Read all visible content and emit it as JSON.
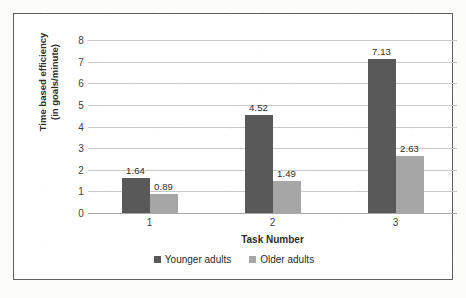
{
  "chart_data": {
    "type": "bar",
    "title": "",
    "subtitle": "",
    "xlabel": "Task Number",
    "ylabel": "Time based efficiency (in goals/minute)",
    "ylabel_line1": "Time based efficiency",
    "ylabel_line2": "(in goals/minute)",
    "categories": [
      "1",
      "2",
      "3"
    ],
    "series": [
      {
        "name": "Younger adults",
        "color": "#595959",
        "values": [
          1.64,
          4.52,
          7.13
        ],
        "labels": [
          "1.64",
          "4.52",
          "7.13"
        ]
      },
      {
        "name": "Older adults",
        "color": "#a6a6a6",
        "values": [
          0.89,
          1.49,
          2.63
        ],
        "labels": [
          "0.89",
          "1.49",
          "2.63"
        ]
      }
    ],
    "ylim": [
      0,
      8
    ],
    "ytick_values": [
      0,
      1,
      2,
      3,
      4,
      5,
      6,
      7,
      8
    ],
    "ytick_labels": [
      "0",
      "1",
      "2",
      "3",
      "4",
      "5",
      "6",
      "7",
      "8"
    ],
    "grid": true,
    "grid_axis": "y",
    "legend_position": "bottom",
    "data_labels": true,
    "border": true
  },
  "colors": {
    "younger": "#595959",
    "older": "#a6a6a6",
    "gridline": "#c9c9c9",
    "border": "#5f5f5f",
    "text": "#2b2b2b",
    "background": "#ffffff"
  }
}
